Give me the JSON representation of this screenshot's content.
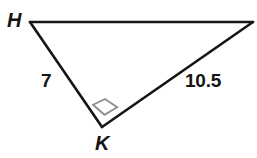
{
  "figure": {
    "type": "right-triangle-diagram",
    "background_color": "#ffffff",
    "stroke_color": "#151515",
    "stroke_width": 2.6,
    "right_angle_marker": {
      "at_vertex": "K",
      "color": "#8d8d8d",
      "fill": "#ffffff",
      "size": 15
    },
    "vertices": [
      {
        "name": "H",
        "label": "H",
        "x": 30,
        "y": 22,
        "labeled": true
      },
      {
        "name": "J",
        "label": "",
        "x": 253,
        "y": 22,
        "labeled": false
      },
      {
        "name": "K",
        "label": "K",
        "x": 102,
        "y": 127,
        "labeled": true
      }
    ],
    "edges": [
      {
        "name": "edge-H-J",
        "from": "H",
        "to": "J",
        "length_label": ""
      },
      {
        "name": "edge-H-K",
        "from": "H",
        "to": "K",
        "length_label": "7"
      },
      {
        "name": "edge-K-J",
        "from": "K",
        "to": "J",
        "length_label": "10.5"
      }
    ],
    "labels": {
      "vertex_H": "H",
      "vertex_K": "K",
      "side_HK": "7",
      "side_KJ": "10.5"
    }
  }
}
